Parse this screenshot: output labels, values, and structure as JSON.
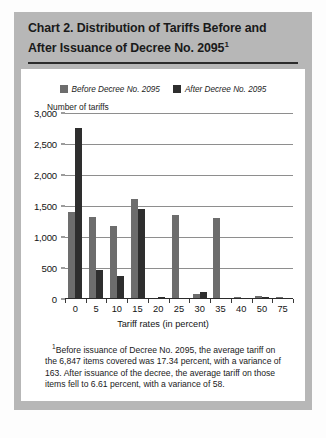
{
  "title": {
    "line1": "Chart 2. Distribution of Tariffs Before and",
    "line2": "After Issuance of Decree  No. 2095",
    "footnote_marker": "1"
  },
  "colors": {
    "before": "#6d6d6d",
    "after": "#2e2e2e",
    "frame": "#b7b7b7",
    "panel": "#ffffff",
    "gridline": "#8e8e8e",
    "axis": "#2b2b2b"
  },
  "legend": {
    "items": [
      {
        "label": "Before Decree No. 2095",
        "swatch": "before-swatch"
      },
      {
        "label": "After Decree No. 2095",
        "swatch": "after-swatch"
      }
    ]
  },
  "footnote": {
    "marker": "1",
    "text": "Before issuance of Decree No. 2095, the average tariff on the 6,847 items covered was 17.34 percent, with a variance of 163. After issuance of the decree, the average tariff on those items fell to 6.61 percent, with a variance of 58."
  },
  "chart_data": {
    "type": "bar",
    "title": "Chart 2. Distribution of Tariffs Before and After Issuance of Decree No. 2095",
    "xlabel": "Tariff rates (in percent)",
    "ylabel": "Number of tariffs",
    "categories": [
      "0",
      "5",
      "10",
      "15",
      "20",
      "25",
      "30",
      "35",
      "40",
      "50",
      "75"
    ],
    "series": [
      {
        "name": "Before Decree No. 2095",
        "color": "#6d6d6d",
        "values": [
          1400,
          1320,
          1180,
          1620,
          0,
          1360,
          85,
          1300,
          30,
          55,
          25
        ]
      },
      {
        "name": "After Decree No. 2095",
        "color": "#2e2e2e",
        "values": [
          2760,
          470,
          370,
          1450,
          30,
          0,
          120,
          0,
          20,
          40,
          15
        ]
      }
    ],
    "ylim": [
      0,
      3000
    ],
    "yticks": [
      0,
      500,
      1000,
      1500,
      2000,
      2500,
      3000
    ],
    "ytick_labels": [
      "0",
      "500",
      "1,000",
      "1,500",
      "2,000",
      "2,500",
      "3,000"
    ],
    "grid": true,
    "legend_position": "top-center"
  }
}
